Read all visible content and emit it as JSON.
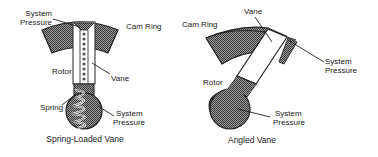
{
  "diagram": {
    "colors": {
      "ink": "#222222",
      "hatch": "#6a6a6a",
      "background": "#ffffff"
    },
    "left": {
      "caption": "Spring-Loaded Vane",
      "labels": {
        "system_pressure_top_line1": "System",
        "system_pressure_top_line2": "Pressure",
        "cam_ring": "Cam Ring",
        "rotor": "Rotor",
        "vane": "Vane",
        "spring": "Spring",
        "system_pressure_bottom_line1": "System",
        "system_pressure_bottom_line2": "Pressure"
      }
    },
    "right": {
      "caption": "Angled Vane",
      "labels": {
        "vane": "Vane",
        "cam_ring": "Cam Ring",
        "system_pressure_top_line1": "System",
        "system_pressure_top_line2": "Pressure",
        "rotor": "Rotor",
        "system_pressure_bottom_line1": "System",
        "system_pressure_bottom_line2": "Pressure"
      }
    }
  }
}
